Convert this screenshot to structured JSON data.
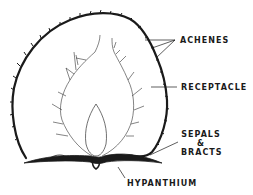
{
  "diagram": {
    "labels": {
      "achenes": "ACHENES",
      "receptacle": "RECEPTACLE",
      "sepals_line1": "SEPALS",
      "sepals_line2": "&",
      "sepals_line3": "BRACTS",
      "hypanthium": "HYPANTHIUM"
    },
    "colors": {
      "ink": "#1a1a1a",
      "background": "#ffffff"
    }
  }
}
